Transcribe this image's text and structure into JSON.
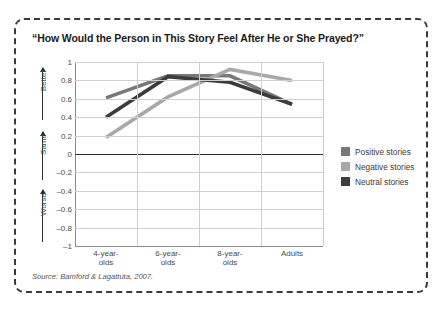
{
  "figure": {
    "title": "“How Would the Person in This Story Feel After He or She Prayed?”",
    "source_label": "Source:",
    "source_text": " Bamford & Lagattuta, 2007."
  },
  "legend": {
    "position": "right",
    "items": [
      {
        "label": "Positive stories",
        "color": "#787878"
      },
      {
        "label": "Negative stories",
        "color": "#a8a8a8"
      },
      {
        "label": "Neutral stories",
        "color": "#3c3c3c"
      }
    ]
  },
  "axis": {
    "y_direction_labels": [
      {
        "text": "Better"
      },
      {
        "text": "Same"
      },
      {
        "text": "Worse"
      }
    ]
  },
  "chart_data": {
    "type": "line",
    "title": "“How Would the Person in This Story Feel After He or She Prayed?”",
    "xlabel": "",
    "ylabel": "",
    "categories": [
      "4-year-olds",
      "6-year-olds",
      "8-year-olds",
      "Adults"
    ],
    "category_lines": [
      [
        "4-year-",
        "olds"
      ],
      [
        "6-year-",
        "olds"
      ],
      [
        "8-year-",
        "olds"
      ],
      [
        "Adults",
        ""
      ]
    ],
    "ylim": [
      -1,
      1
    ],
    "yticks": [
      1,
      0.8,
      0.6,
      0.4,
      0.2,
      0,
      -0.2,
      -0.4,
      -0.6,
      -0.8,
      -1
    ],
    "ytick_labels": [
      "1",
      "0.8",
      "0.6",
      "0.4",
      "0.2",
      "0",
      "–0.2",
      "–0.4",
      "–0.6",
      "–0.8",
      "–1"
    ],
    "grid": true,
    "zero_line": 0,
    "legend_position": "right",
    "series": [
      {
        "name": "Positive stories",
        "color": "#787878",
        "values": [
          0.61,
          0.85,
          0.85,
          0.54
        ]
      },
      {
        "name": "Negative stories",
        "color": "#a8a8a8",
        "values": [
          0.18,
          0.62,
          0.92,
          0.8
        ]
      },
      {
        "name": "Neutral stories",
        "color": "#3c3c3c",
        "values": [
          0.4,
          0.84,
          0.78,
          0.54
        ]
      }
    ]
  }
}
